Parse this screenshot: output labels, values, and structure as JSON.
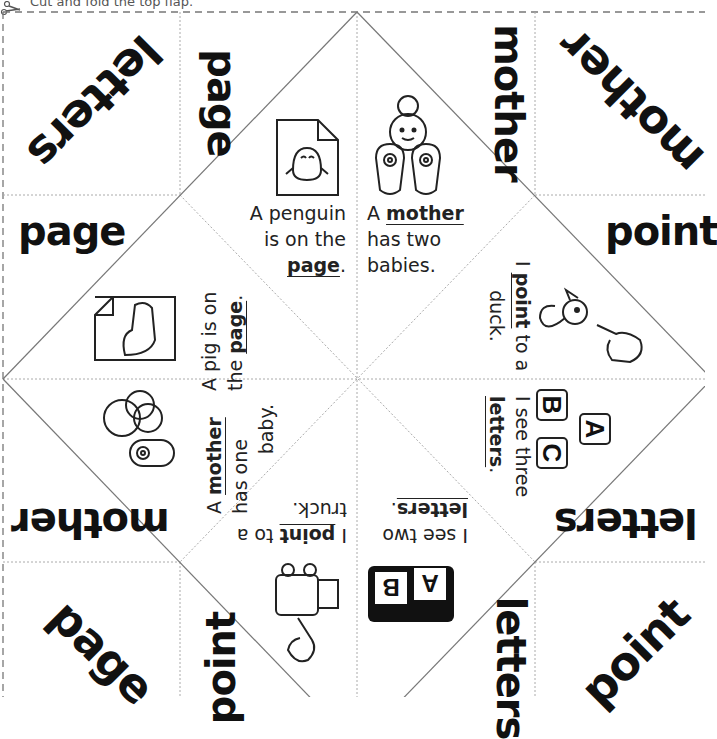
{
  "instruction": "Cut and fold the top flap.",
  "corners": {
    "top_left": "letters",
    "top_left_right": "page",
    "top_left_below": "page",
    "top_right_left": "mother",
    "top_right": "mother",
    "top_right_below": "point",
    "bottom_left_above": "mother",
    "bottom_left": "page",
    "bottom_left_right": "point",
    "bottom_right_above": "letters",
    "bottom_right_left": "letters",
    "bottom_right": "point"
  },
  "panels": {
    "penguin": {
      "pre1": "A penguin",
      "pre2": "is on the",
      "word": "page",
      "post": "."
    },
    "mother_two": {
      "pre": "A ",
      "word": "mother",
      "line2": "has two",
      "line3": "babies."
    },
    "pig": {
      "line1": "A pig is on",
      "pre2": "the ",
      "word": "page",
      "post": "."
    },
    "duck": {
      "pre": "I ",
      "word": "point",
      "post": " to a",
      "line2": "duck."
    },
    "mother_one": {
      "pre": "A ",
      "word": "mother",
      "line2": "has one",
      "line3": "baby."
    },
    "abc": {
      "line1": "I see three",
      "word": "letters",
      "post": ".",
      "blocks": [
        "A",
        "B",
        "C"
      ]
    },
    "truck": {
      "pre": "I ",
      "word": "point",
      "post": " to a",
      "line2": "truck."
    },
    "ab": {
      "line1": "I see two",
      "word": "letters",
      "post": ".",
      "blocks": [
        "A",
        "B"
      ]
    }
  }
}
